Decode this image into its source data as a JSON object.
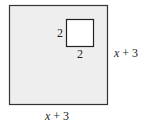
{
  "diagram": {
    "outer_square": {
      "side_label_right": "x + 3",
      "side_label_bottom": "x + 3",
      "fill": "#eeeeee",
      "stroke": "#333333"
    },
    "inner_square": {
      "side_label_left": "2",
      "side_label_bottom": "2",
      "fill": "#ffffff",
      "stroke": "#222222"
    }
  }
}
